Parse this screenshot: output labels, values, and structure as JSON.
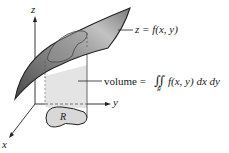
{
  "diagram": {
    "axes": {
      "z_label": "z",
      "y_label": "y",
      "x_label": "x"
    },
    "surface_label": "z = f(x, y)",
    "volume_label_prefix": "volume =",
    "volume_integral": "∬",
    "volume_integrand": "f(x, y) dx dy",
    "integral_subscript": "R",
    "region_label": "R",
    "colors": {
      "surface_dark": "#5a5a5a",
      "surface_light": "#b8b8b8",
      "column_fill": "#e4e4e4",
      "region_fill": "#d8d8d8",
      "outline": "#222222"
    }
  }
}
